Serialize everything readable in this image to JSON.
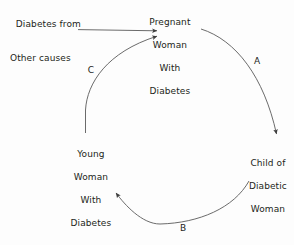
{
  "diagram": {
    "background_color": "#fdfdfd",
    "stroke_color": "#444444",
    "text_color": "#231f20",
    "nodes": [
      {
        "id": "source",
        "name": "diabetes-other-causes",
        "line1": "Diabetes from",
        "line2": "Other causes"
      },
      {
        "id": "pregnant",
        "name": "pregnant-woman-with-diabetes",
        "line1": "Pregnant",
        "line2": "Woman",
        "line3": "With",
        "line4": "Diabetes"
      },
      {
        "id": "child",
        "name": "child-of-diabetic-woman",
        "line1": "Child of",
        "line2": "Diabetic",
        "line3": "Woman"
      },
      {
        "id": "young",
        "name": "young-woman-with-diabetes",
        "line1": "Young",
        "line2": "Woman",
        "line3": "With",
        "line4": "Diabetes"
      }
    ],
    "edges": [
      {
        "id": "a",
        "label": "A",
        "from": "pregnant",
        "to": "child"
      },
      {
        "id": "b",
        "label": "B",
        "from": "child",
        "to": "young"
      },
      {
        "id": "c",
        "label": "C",
        "from": "young",
        "to": "pregnant"
      },
      {
        "id": "entry",
        "label": "",
        "from": "source",
        "to": "pregnant"
      }
    ]
  }
}
